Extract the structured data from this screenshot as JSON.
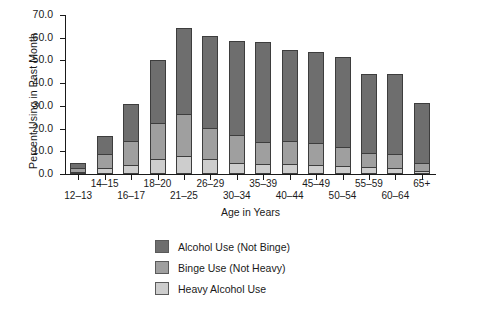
{
  "chart_data": {
    "type": "bar",
    "subtype": "stacked",
    "title": "",
    "xlabel": "Age in Years",
    "ylabel": "Percent Using in Past Month",
    "ylim": [
      0.0,
      70.0
    ],
    "ytick_labels": [
      "0.0",
      "10.0",
      "20.0",
      "30.0",
      "40.0",
      "50.0",
      "60.0",
      "70.0"
    ],
    "ytick_values": [
      0.0,
      10.0,
      20.0,
      30.0,
      40.0,
      50.0,
      60.0,
      70.0
    ],
    "grid": false,
    "legend_position": "below-plot-center",
    "categories": [
      "12–13",
      "14–15",
      "16–17",
      "18–20",
      "21–25",
      "26–29",
      "30–34",
      "35–39",
      "40–44",
      "45–49",
      "50–54",
      "55–59",
      "60–64",
      "65+"
    ],
    "series": [
      {
        "name": "Heavy Alcohol Use",
        "color": "#cdcdcd",
        "values": [
          0.5,
          2.0,
          3.5,
          6.2,
          7.5,
          6.0,
          4.2,
          4.0,
          3.8,
          3.6,
          3.3,
          2.7,
          2.2,
          1.0
        ]
      },
      {
        "name": "Binge Use (Not Heavy)",
        "color": "#9f9f9f",
        "values": [
          1.7,
          6.4,
          10.6,
          16.0,
          18.6,
          14.0,
          12.6,
          9.8,
          10.2,
          9.6,
          8.0,
          6.1,
          6.0,
          3.5
        ]
      },
      {
        "name": "Alcohol Use (Not Binge)",
        "color": "#6e6e6e",
        "values": [
          2.1,
          7.9,
          16.3,
          27.4,
          37.8,
          40.4,
          41.2,
          44.1,
          40.1,
          40.1,
          39.6,
          34.9,
          35.3,
          26.2
        ]
      }
    ],
    "totals": [
      4.3,
      16.3,
      30.4,
      49.6,
      63.9,
      60.4,
      58.0,
      57.9,
      54.1,
      53.3,
      50.9,
      43.7,
      43.5,
      30.7
    ]
  },
  "legend": {
    "items": [
      {
        "label": "Alcohol Use (Not Binge)",
        "color": "#6e6e6e"
      },
      {
        "label": "Binge Use (Not Heavy)",
        "color": "#9f9f9f"
      },
      {
        "label": "Heavy Alcohol Use",
        "color": "#cdcdcd"
      }
    ]
  }
}
